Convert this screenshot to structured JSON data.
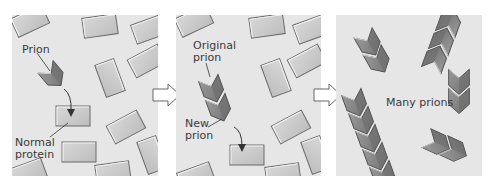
{
  "diagram": {
    "colors": {
      "background": "#ffffff",
      "panel_bg": "#e6e6e6",
      "normal_protein_fill": "#c9c9c9",
      "normal_protein_border": "#6a6a6a",
      "prion_fill": "#8a8a8a",
      "prion_dark": "#5e5e5e",
      "text": "#3a3a3a"
    },
    "panels": [
      {
        "id": "panel-1",
        "labels": {
          "prion": "Prion",
          "normal_protein": "Normal\nprotein"
        }
      },
      {
        "id": "panel-2",
        "labels": {
          "original_prion": "Original\nprion",
          "new_prion": "New\nprion"
        }
      },
      {
        "id": "panel-3",
        "labels": {
          "many_prions": "Many prions"
        }
      }
    ],
    "step_arrows": [
      "arrow-1-to-2",
      "arrow-2-to-3"
    ]
  }
}
